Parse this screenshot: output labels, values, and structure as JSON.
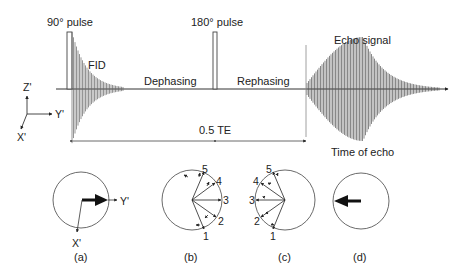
{
  "pulse_sequence": {
    "pulse_90_label": "90° pulse",
    "pulse_180_label": "180° pulse",
    "fid_label": "FID",
    "dephasing_label": "Dephasing",
    "rephasing_label": "Rephasing",
    "echo_label": "Echo signal",
    "half_te_label": "0.5 TE",
    "time_of_echo_label": "Time of echo"
  },
  "axes": {
    "z_label": "Z'",
    "y_label": "Y'",
    "x_label": "X'"
  },
  "phase_diagrams": [
    {
      "id": "a",
      "caption": "(a)",
      "y_label": "Y'",
      "x_label": "X'"
    },
    {
      "id": "b",
      "caption": "(b)",
      "numbers": [
        "1",
        "2",
        "3",
        "4",
        "5"
      ]
    },
    {
      "id": "c",
      "caption": "(c)",
      "numbers": [
        "1",
        "2",
        "3",
        "4",
        "5"
      ]
    },
    {
      "id": "d",
      "caption": "(d)"
    }
  ],
  "colors": {
    "ink": "#222222",
    "signal": "#555555",
    "background": "#ffffff"
  }
}
